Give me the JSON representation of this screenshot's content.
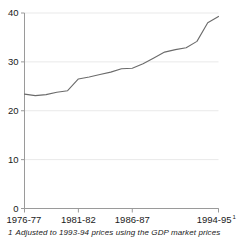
{
  "chart_data": {
    "type": "line",
    "title": "",
    "xlabel": "",
    "ylabel": "",
    "ylim": [
      0,
      40
    ],
    "yticks": [
      0,
      10,
      20,
      30,
      40
    ],
    "ytick_labels": [
      "0",
      "10",
      "20",
      "30",
      "40"
    ],
    "grid": true,
    "grid_axis": "y",
    "legend": "none",
    "line_color": "#6b6b6b",
    "grid_color": "#e9e9e9",
    "axis_color": "#9a9a9a",
    "categories": [
      "1976-77",
      "1977-78",
      "1978-79",
      "1979-80",
      "1980-81",
      "1981-82",
      "1982-83",
      "1983-84",
      "1984-85",
      "1985-86",
      "1986-87",
      "1987-88",
      "1988-89",
      "1989-90",
      "1990-91",
      "1991-92",
      "1992-93",
      "1993-94",
      "1994-95"
    ],
    "values": [
      23.4,
      23.1,
      23.3,
      23.8,
      24.1,
      26.5,
      26.9,
      27.4,
      27.9,
      28.6,
      28.7,
      29.6,
      30.8,
      32.0,
      32.5,
      32.9,
      34.2,
      38.0,
      39.3
    ],
    "xtick_labels": [
      "1976-77",
      "1981-82",
      "1986-87",
      "1994-95"
    ],
    "xtick_indices": [
      0,
      5,
      10,
      18
    ],
    "xtick_superscript": [
      "",
      "",
      "",
      "1"
    ],
    "annotations": []
  },
  "footnote": {
    "number": "1",
    "text": "Adjusted to 1993-94 prices using the GDP market prices"
  }
}
